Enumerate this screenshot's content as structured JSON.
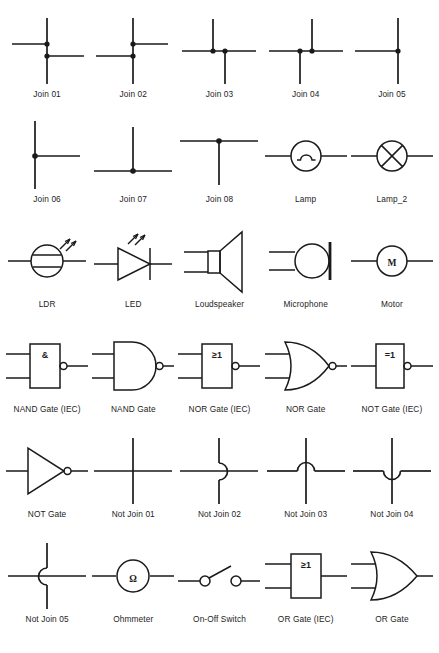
{
  "page": {
    "background_color": "#ffffff",
    "ink_color": "#1a1a1a",
    "columns": 5,
    "rows": 6,
    "symbol_count": 30
  },
  "symbols": [
    {
      "id": "join-01",
      "caption": "Join 01",
      "icon": "join-01-icon",
      "glyph": ""
    },
    {
      "id": "join-02",
      "caption": "Join 02",
      "icon": "join-02-icon",
      "glyph": ""
    },
    {
      "id": "join-03",
      "caption": "Join 03",
      "icon": "join-03-icon",
      "glyph": ""
    },
    {
      "id": "join-04",
      "caption": "Join 04",
      "icon": "join-04-icon",
      "glyph": ""
    },
    {
      "id": "join-05",
      "caption": "Join 05",
      "icon": "join-05-icon",
      "glyph": ""
    },
    {
      "id": "join-06",
      "caption": "Join 06",
      "icon": "join-06-icon",
      "glyph": ""
    },
    {
      "id": "join-07",
      "caption": "Join 07",
      "icon": "join-07-icon",
      "glyph": ""
    },
    {
      "id": "join-08",
      "caption": "Join 08",
      "icon": "join-08-icon",
      "glyph": ""
    },
    {
      "id": "lamp",
      "caption": "Lamp",
      "icon": "lamp-icon",
      "glyph": ""
    },
    {
      "id": "lamp-2",
      "caption": "Lamp_2",
      "icon": "lamp-2-icon",
      "glyph": ""
    },
    {
      "id": "ldr",
      "caption": "LDR",
      "icon": "ldr-icon",
      "glyph": ""
    },
    {
      "id": "led",
      "caption": "LED",
      "icon": "led-icon",
      "glyph": ""
    },
    {
      "id": "loudspeaker",
      "caption": "Loudspeaker",
      "icon": "loudspeaker-icon",
      "glyph": ""
    },
    {
      "id": "microphone",
      "caption": "Microphone",
      "icon": "microphone-icon",
      "glyph": ""
    },
    {
      "id": "motor",
      "caption": "Motor",
      "icon": "motor-icon",
      "glyph": "M"
    },
    {
      "id": "nand-gate-iec",
      "caption": "NAND Gate (IEC)",
      "icon": "nand-gate-iec-icon",
      "glyph": "&"
    },
    {
      "id": "nand-gate",
      "caption": "NAND Gate",
      "icon": "nand-gate-icon",
      "glyph": ""
    },
    {
      "id": "nor-gate-iec",
      "caption": "NOR Gate (IEC)",
      "icon": "nor-gate-iec-icon",
      "glyph": "≥1"
    },
    {
      "id": "nor-gate",
      "caption": "NOR Gate",
      "icon": "nor-gate-icon",
      "glyph": ""
    },
    {
      "id": "not-gate-iec",
      "caption": "NOT Gate (IEC)",
      "icon": "not-gate-iec-icon",
      "glyph": "=1"
    },
    {
      "id": "not-gate",
      "caption": "NOT Gate",
      "icon": "not-gate-icon",
      "glyph": ""
    },
    {
      "id": "not-join-01",
      "caption": "Not Join 01",
      "icon": "not-join-01-icon",
      "glyph": ""
    },
    {
      "id": "not-join-02",
      "caption": "Not Join 02",
      "icon": "not-join-02-icon",
      "glyph": ""
    },
    {
      "id": "not-join-03",
      "caption": "Not Join 03",
      "icon": "not-join-03-icon",
      "glyph": ""
    },
    {
      "id": "not-join-04",
      "caption": "Not Join 04",
      "icon": "not-join-04-icon",
      "glyph": ""
    },
    {
      "id": "not-join-05",
      "caption": "Not Join 05",
      "icon": "not-join-05-icon",
      "glyph": ""
    },
    {
      "id": "ohmmeter",
      "caption": "Ohmmeter",
      "icon": "ohmmeter-icon",
      "glyph": "Ω"
    },
    {
      "id": "on-off-switch",
      "caption": "On-Off Switch",
      "icon": "on-off-switch-icon",
      "glyph": ""
    },
    {
      "id": "or-gate-iec",
      "caption": "OR Gate (IEC)",
      "icon": "or-gate-iec-icon",
      "glyph": "≥1"
    },
    {
      "id": "or-gate",
      "caption": "OR Gate",
      "icon": "or-gate-icon",
      "glyph": ""
    }
  ]
}
